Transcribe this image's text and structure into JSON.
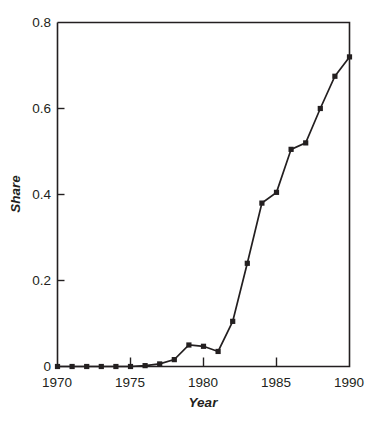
{
  "chart_data": {
    "type": "line",
    "title": "",
    "subtitle": "",
    "xlabel": "Year",
    "ylabel": "Share",
    "xlim": [
      1970,
      1990
    ],
    "ylim": [
      0,
      0.8
    ],
    "grid": false,
    "legend": null,
    "legend_position": "none",
    "marker": "square",
    "line_color": "#231f20",
    "marker_color": "#231f20",
    "x_ticks": [
      1970,
      1975,
      1980,
      1985,
      1990
    ],
    "x_tick_labels": [
      "1970",
      "1975",
      "1980",
      "1985",
      "1990"
    ],
    "x_minor_ticks": [
      1975,
      1980,
      1985
    ],
    "y_ticks": [
      0,
      0.2,
      0.4,
      0.6,
      0.8
    ],
    "y_tick_labels": [
      "0",
      "0.2",
      "0.4",
      "0.6",
      "0.8"
    ],
    "x": [
      1970,
      1971,
      1972,
      1973,
      1974,
      1975,
      1976,
      1977,
      1978,
      1979,
      1980,
      1981,
      1982,
      1983,
      1984,
      1985,
      1986,
      1987,
      1988,
      1989,
      1990
    ],
    "values": [
      0.0,
      0.0,
      0.0,
      0.0,
      0.0,
      0.0,
      0.002,
      0.006,
      0.016,
      0.05,
      0.047,
      0.035,
      0.105,
      0.24,
      0.38,
      0.405,
      0.505,
      0.52,
      0.6,
      0.675,
      0.72
    ],
    "series": [
      {
        "name": "Share",
        "values": [
          0.0,
          0.0,
          0.0,
          0.0,
          0.0,
          0.0,
          0.002,
          0.006,
          0.016,
          0.05,
          0.047,
          0.035,
          0.105,
          0.24,
          0.38,
          0.405,
          0.505,
          0.52,
          0.6,
          0.675,
          0.72
        ]
      }
    ]
  },
  "figure": {
    "background_color": "#ffffff",
    "ink_color": "#231f20",
    "caption_ghost": ""
  }
}
